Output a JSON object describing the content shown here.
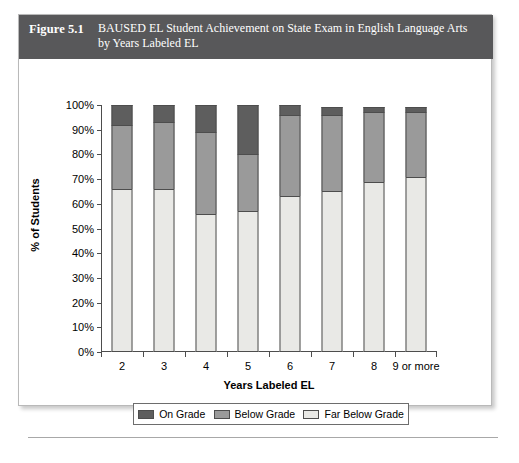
{
  "figure": {
    "number": "Figure 5.1",
    "caption": "BAUSED EL Student Achievement on State Exam in English Language Arts by Years Labeled EL",
    "banner_color": "#58585a"
  },
  "chart_data": {
    "type": "bar",
    "stacked": true,
    "title": "BAUSED EL Student Achievement on State Exam in English Language Arts by Years Labeled EL",
    "xlabel": "Years Labeled EL",
    "ylabel": "% of Students",
    "categories": [
      "2",
      "3",
      "4",
      "5",
      "6",
      "7",
      "8",
      "9 or more"
    ],
    "ylim": [
      0,
      100
    ],
    "ytick_labels": [
      "0%",
      "10%",
      "20%",
      "30%",
      "40%",
      "50%",
      "60%",
      "70%",
      "80%",
      "90%",
      "100%"
    ],
    "ytick_values": [
      0,
      10,
      20,
      30,
      40,
      50,
      60,
      70,
      80,
      90,
      100
    ],
    "grid": false,
    "legend_position": "bottom",
    "series": [
      {
        "name": "Far Below Grade",
        "color": "#e9e9e6",
        "values": [
          66,
          66,
          56,
          57,
          63,
          65,
          69,
          71
        ]
      },
      {
        "name": "Below Grade",
        "color": "#9a9a9a",
        "values": [
          26,
          27,
          33,
          23,
          33,
          31,
          28,
          26
        ]
      },
      {
        "name": "On Grade",
        "color": "#5e5e5e",
        "values": [
          8,
          7,
          11,
          20,
          4,
          3,
          2,
          2
        ]
      }
    ]
  },
  "legend": {
    "items": [
      {
        "label": "On Grade",
        "color": "#5e5e5e"
      },
      {
        "label": "Below Grade",
        "color": "#9a9a9a"
      },
      {
        "label": "Far Below Grade",
        "color": "#e9e9e6"
      }
    ]
  }
}
